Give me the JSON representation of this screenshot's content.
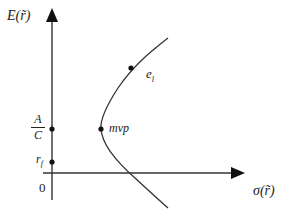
{
  "diagram": {
    "type": "efficient-frontier",
    "y_axis_label": "E(r̃)",
    "x_axis_label": "σ(r̃)",
    "origin_label": "0",
    "y_axis_marks": {
      "fraction": {
        "numerator": "A",
        "denominator": "C"
      },
      "risk_free": "r_f"
    },
    "risk_free_label_main": "r",
    "risk_free_label_sub": "f",
    "points": [
      {
        "id": "mvp",
        "label": "mvp"
      },
      {
        "id": "e1",
        "label_main": "e",
        "label_sub": "l"
      }
    ],
    "colors": {
      "line": "#333333",
      "text": "#222222"
    }
  }
}
